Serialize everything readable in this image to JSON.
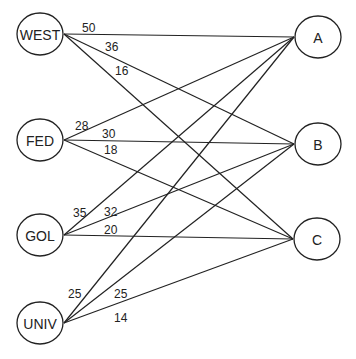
{
  "diagram": {
    "type": "bipartite-network",
    "sources": [
      {
        "id": "WEST",
        "label": "WEST",
        "cx": 40,
        "cy": 34
      },
      {
        "id": "FED",
        "label": "FED",
        "cx": 40,
        "cy": 140
      },
      {
        "id": "GOL",
        "label": "GOL",
        "cx": 40,
        "cy": 235
      },
      {
        "id": "UNIV",
        "label": "UNIV",
        "cx": 40,
        "cy": 323
      }
    ],
    "targets": [
      {
        "id": "A",
        "label": "A",
        "cx": 318,
        "cy": 37
      },
      {
        "id": "B",
        "label": "B",
        "cx": 318,
        "cy": 144
      },
      {
        "id": "C",
        "label": "C",
        "cx": 317,
        "cy": 239
      }
    ],
    "edges": [
      {
        "from": "WEST",
        "to": "A",
        "weight": "50",
        "lx": 82,
        "ly": 32
      },
      {
        "from": "WEST",
        "to": "B",
        "weight": "36",
        "lx": 105,
        "ly": 51
      },
      {
        "from": "WEST",
        "to": "C",
        "weight": "16",
        "lx": 115,
        "ly": 75
      },
      {
        "from": "FED",
        "to": "A",
        "weight": "28",
        "lx": 75,
        "ly": 130
      },
      {
        "from": "FED",
        "to": "B",
        "weight": "30",
        "lx": 102,
        "ly": 138
      },
      {
        "from": "FED",
        "to": "C",
        "weight": "18",
        "lx": 104,
        "ly": 154
      },
      {
        "from": "GOL",
        "to": "A",
        "weight": "35",
        "lx": 73,
        "ly": 217
      },
      {
        "from": "GOL",
        "to": "B",
        "weight": "32",
        "lx": 104,
        "ly": 216
      },
      {
        "from": "GOL",
        "to": "C",
        "weight": "20",
        "lx": 104,
        "ly": 234
      },
      {
        "from": "UNIV",
        "to": "A",
        "weight": "25",
        "lx": 68,
        "ly": 298
      },
      {
        "from": "UNIV",
        "to": "B",
        "weight": "25",
        "lx": 114,
        "ly": 298
      },
      {
        "from": "UNIV",
        "to": "C",
        "weight": "14",
        "lx": 114,
        "ly": 322
      }
    ]
  }
}
